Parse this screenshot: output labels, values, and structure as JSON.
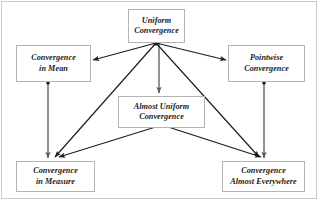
{
  "diagram": {
    "type": "directed-graph",
    "canvas": {
      "width": 320,
      "height": 202,
      "background": "#ffffff",
      "frame_color": "#c9c9c9"
    },
    "style": {
      "node_fill": "#ffffff",
      "node_border": "#b4b4b4",
      "edge_color": "#1b1b1b",
      "vertical_edge_color": "#6e6e6e",
      "text_color": "#1b1b1b"
    },
    "nodes": [
      {
        "id": "uniform",
        "label": "Uniform\nConvergence",
        "x": 128,
        "y": 9,
        "w": 57,
        "h": 34
      },
      {
        "id": "mean",
        "label": "Convergence\nin Mean",
        "x": 16,
        "y": 45,
        "w": 75,
        "h": 37
      },
      {
        "id": "pointwise",
        "label": "Pointwise\nConvergence",
        "x": 228,
        "y": 45,
        "w": 77,
        "h": 37
      },
      {
        "id": "almost",
        "label": "Almost Uniform\nConvergence",
        "x": 118,
        "y": 96,
        "w": 87,
        "h": 32
      },
      {
        "id": "measure",
        "label": "Convergence\nin Measure",
        "x": 16,
        "y": 161,
        "w": 79,
        "h": 31
      },
      {
        "id": "ae",
        "label": "Convergence\nAlmost Everywhere",
        "x": 222,
        "y": 161,
        "w": 83,
        "h": 31
      }
    ],
    "hubs": [
      {
        "id": "hub-uniform",
        "x": 156,
        "y": 43
      },
      {
        "id": "hub-almost",
        "x": 162,
        "y": 125
      },
      {
        "id": "hub-mean",
        "x": 48,
        "y": 83
      },
      {
        "id": "hub-pointwise",
        "x": 264,
        "y": 83
      }
    ],
    "edges": [
      {
        "id": "uniform-to-mean",
        "from": "uniform",
        "to": "mean",
        "x1": 156,
        "y1": 43,
        "x2": 93,
        "y2": 60,
        "kind": "diagonal"
      },
      {
        "id": "uniform-to-measure",
        "from": "uniform",
        "to": "measure",
        "x1": 156,
        "y1": 43,
        "x2": 55,
        "y2": 158,
        "kind": "diagonal"
      },
      {
        "id": "uniform-to-almost",
        "from": "uniform",
        "to": "almost",
        "x1": 159,
        "y1": 43,
        "x2": 159,
        "y2": 94,
        "kind": "vertical"
      },
      {
        "id": "uniform-to-ae",
        "from": "uniform",
        "to": "ae",
        "x1": 156,
        "y1": 43,
        "x2": 259,
        "y2": 158,
        "kind": "diagonal"
      },
      {
        "id": "uniform-to-pointwise",
        "from": "uniform",
        "to": "pointwise",
        "x1": 156,
        "y1": 43,
        "x2": 226,
        "y2": 60,
        "kind": "diagonal"
      },
      {
        "id": "almost-to-measure",
        "from": "almost",
        "to": "measure",
        "x1": 162,
        "y1": 125,
        "x2": 58,
        "y2": 158,
        "kind": "diagonal"
      },
      {
        "id": "almost-to-ae",
        "from": "almost",
        "to": "ae",
        "x1": 162,
        "y1": 125,
        "x2": 262,
        "y2": 158,
        "kind": "diagonal"
      },
      {
        "id": "mean-to-measure",
        "from": "mean",
        "to": "measure",
        "x1": 48,
        "y1": 84,
        "x2": 48,
        "y2": 159,
        "kind": "vertical"
      },
      {
        "id": "pointwise-to-ae",
        "from": "pointwise",
        "to": "ae",
        "x1": 264,
        "y1": 84,
        "x2": 264,
        "y2": 159,
        "kind": "vertical"
      }
    ]
  }
}
